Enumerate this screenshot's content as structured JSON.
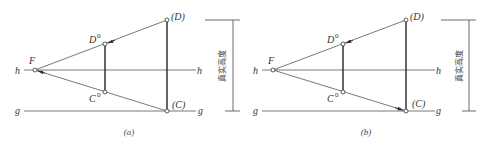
{
  "figure": {
    "panels": [
      {
        "caption": "(a)",
        "labels": {
          "F": "F",
          "D0_base": "D",
          "D0_sup": "0",
          "C0_base": "C",
          "C0_sup": "0",
          "D": "(D)",
          "C": "(C)",
          "h_left": "h",
          "h_right": "h",
          "g_left": "g",
          "g_right": "g",
          "dimension": "真实高度"
        },
        "arrows": "toward F and D0 (from D and C through measuring points)"
      },
      {
        "caption": "(b)",
        "labels": {
          "F": "F",
          "D0_base": "D",
          "D0_sup": "0",
          "C0_base": "C",
          "C0_sup": "0",
          "D": "(D)",
          "C": "(C)",
          "h_left": "h",
          "h_right": "h",
          "g_left": "g",
          "g_right": "g",
          "dimension": "真实高度"
        },
        "arrows": "toward D0 and (C)"
      }
    ]
  }
}
